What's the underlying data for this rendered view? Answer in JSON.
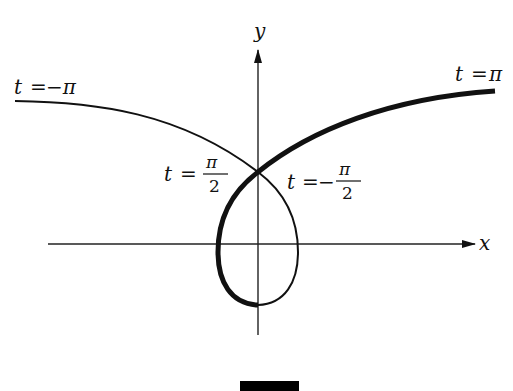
{
  "diagram": {
    "title": "",
    "axes": {
      "x_label": "x",
      "y_label": "y"
    },
    "labels": {
      "start": {
        "t": "t",
        "eq": "=",
        "value": "−π"
      },
      "end": {
        "t": "t",
        "eq": "=",
        "value": "π"
      },
      "left_cross": {
        "t": "t",
        "eq": "=",
        "num": "π",
        "den": "2",
        "sign": ""
      },
      "right_cross": {
        "t": "t",
        "eq": "=",
        "num": "π",
        "den": "2",
        "sign": "−"
      }
    },
    "colors": {
      "stroke": "#111111",
      "background": "#ffffff"
    }
  }
}
